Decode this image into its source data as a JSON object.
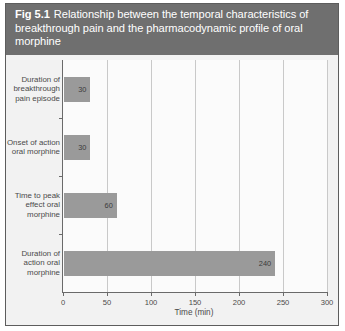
{
  "figure": {
    "number": "Fig 5.1",
    "caption": "Relationship between the temporal characteristics of breakthrough pain and the pharmacodynamic profile of oral morphine",
    "caption_band_color": "#6f6f6f",
    "frame_color": "#5d5d5d",
    "background_color": "#f2f2f2"
  },
  "chart_data": {
    "type": "bar",
    "orientation": "horizontal",
    "title": "Relationship between the temporal characteristics of breakthrough pain and the pharmacodynamic profile of oral morphine",
    "categories": [
      "Duration of breakthrough pain episode",
      "Onset of action oral morphine",
      "Time to peak effect oral morphine",
      "Duration of action oral morphine"
    ],
    "values": [
      30,
      30,
      60,
      240
    ],
    "value_labels": [
      "30",
      "30",
      "60",
      "240"
    ],
    "xlabel": "Time (min)",
    "ylabel": "",
    "xlim": [
      0,
      300
    ],
    "xticks": [
      0,
      50,
      100,
      150,
      200,
      250,
      300
    ],
    "xticklabels": [
      "0",
      "50",
      "100",
      "150",
      "200",
      "250",
      "300"
    ],
    "grid": "vertical",
    "legend": "none",
    "bar_color": "#9a9a9a",
    "plot_background": "#fbfbfb",
    "gridline_color": "#c9c9c9",
    "axis_color": "#6a6a6a"
  }
}
